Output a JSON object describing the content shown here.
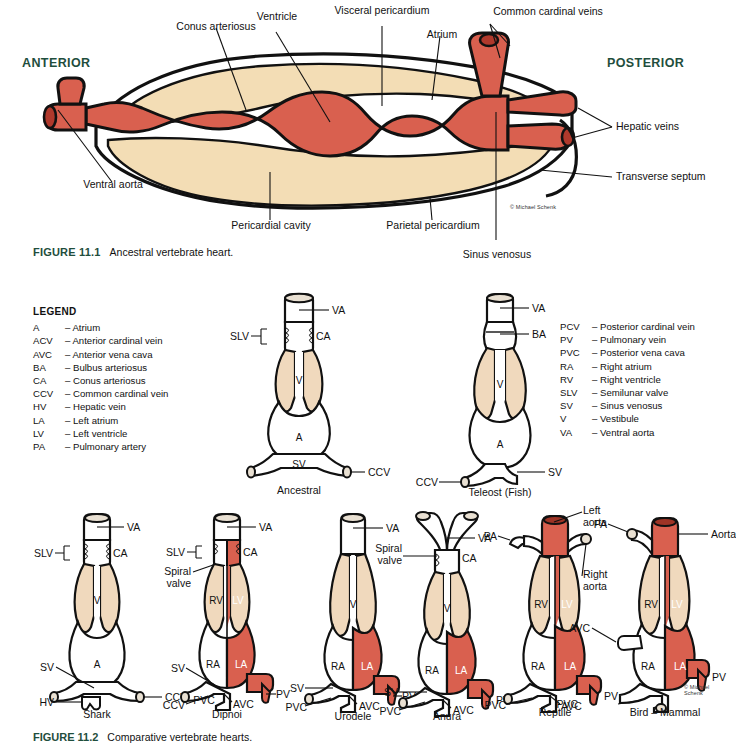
{
  "figure1": {
    "caption_prefix": "FIGURE 11.1",
    "caption_text": "Ancestral vertebrate heart.",
    "anterior": "ANTERIOR",
    "posterior": "POSTERIOR",
    "credit": "© Michael Schenk",
    "labels": {
      "conus_arteriosus": "Conus arteriosus",
      "ventricle": "Ventricle",
      "visceral_pericardium": "Visceral pericardium",
      "atrium": "Atrium",
      "common_cardinal_veins": "Common cardinal veins",
      "hepatic_veins": "Hepatic veins",
      "transverse_septum": "Transverse septum",
      "ventral_aorta": "Ventral aorta",
      "pericardial_cavity": "Pericardial cavity",
      "parietal_pericardium": "Parietal pericardium",
      "sinus_venosus": "Sinus venosus"
    }
  },
  "legend": {
    "title": "LEGEND",
    "left": [
      {
        "abbr": "A",
        "term": "Atrium"
      },
      {
        "abbr": "ACV",
        "term": "Anterior cardinal vein"
      },
      {
        "abbr": "AVC",
        "term": "Anterior vena cava"
      },
      {
        "abbr": "BA",
        "term": "Bulbus arteriosus"
      },
      {
        "abbr": "CA",
        "term": "Conus arteriosus"
      },
      {
        "abbr": "CCV",
        "term": "Common cardinal vein"
      },
      {
        "abbr": "HV",
        "term": "Hepatic vein"
      },
      {
        "abbr": "LA",
        "term": "Left atrium"
      },
      {
        "abbr": "LV",
        "term": "Left ventricle"
      },
      {
        "abbr": "PA",
        "term": "Pulmonary artery"
      }
    ],
    "right": [
      {
        "abbr": "PCV",
        "term": "Posterior cardinal vein"
      },
      {
        "abbr": "PV",
        "term": "Pulmonary vein"
      },
      {
        "abbr": "PVC",
        "term": "Posterior vena cava"
      },
      {
        "abbr": "RA",
        "term": "Right atrium"
      },
      {
        "abbr": "RV",
        "term": "Right ventricle"
      },
      {
        "abbr": "SLV",
        "term": "Semilunar valve"
      },
      {
        "abbr": "SV",
        "term": "Sinus venosus"
      },
      {
        "abbr": "V",
        "term": "Vestibule"
      },
      {
        "abbr": "VA",
        "term": "Ventral aorta"
      }
    ],
    "dash": "–"
  },
  "figure2": {
    "caption_prefix": "FIGURE 11.2",
    "caption_text": "Comparative vertebrate hearts.",
    "credit": "© Michael Schenk",
    "hearts": [
      {
        "id": "ancestral",
        "name": "Ancestral",
        "inner": [
          {
            "text": "V",
            "color": "dark"
          },
          {
            "text": "A",
            "color": "dark"
          },
          {
            "text": "SV",
            "color": "dark"
          }
        ],
        "callouts": [
          "VA",
          "SLV",
          "CA",
          "CCV"
        ]
      },
      {
        "id": "teleost",
        "name": "Teleost (Fish)",
        "inner": [
          {
            "text": "V",
            "color": "dark"
          },
          {
            "text": "A",
            "color": "dark"
          }
        ],
        "callouts": [
          "VA",
          "BA",
          "CCV",
          "SV"
        ]
      },
      {
        "id": "shark",
        "name": "Shark",
        "inner": [
          {
            "text": "V",
            "color": "dark"
          },
          {
            "text": "A",
            "color": "dark"
          }
        ],
        "callouts": [
          "VA",
          "SLV",
          "CA",
          "SV",
          "HV",
          "CCV"
        ]
      },
      {
        "id": "dipnoi",
        "name": "Dipnoi",
        "inner": [
          {
            "text": "RV",
            "color": "dark"
          },
          {
            "text": "LV",
            "color": "white"
          },
          {
            "text": "RA",
            "color": "dark"
          },
          {
            "text": "LA",
            "color": "white"
          }
        ],
        "callouts": [
          "VA",
          "SLV",
          "CA",
          "Spiral valve",
          "SV",
          "CCV",
          "PVC",
          "AVC",
          "PV"
        ]
      },
      {
        "id": "urodele",
        "name": "Urodele",
        "inner": [
          {
            "text": "V",
            "color": "dark"
          },
          {
            "text": "RA",
            "color": "dark"
          },
          {
            "text": "LA",
            "color": "white"
          }
        ],
        "callouts": [
          "VA",
          "SV",
          "PVC",
          "AVC",
          "PV"
        ]
      },
      {
        "id": "anura",
        "name": "Anura",
        "inner": [
          {
            "text": "V",
            "color": "dark"
          },
          {
            "text": "RA",
            "color": "dark"
          },
          {
            "text": "LA",
            "color": "white"
          }
        ],
        "callouts": [
          "Spiral valve",
          "VA",
          "CA",
          "SV",
          "PVC",
          "AVC",
          "PV"
        ]
      },
      {
        "id": "reptile",
        "name": "Reptile",
        "inner": [
          {
            "text": "RV",
            "color": "dark"
          },
          {
            "text": "LV",
            "color": "white"
          },
          {
            "text": "RA",
            "color": "dark"
          },
          {
            "text": "LA",
            "color": "white"
          }
        ],
        "callouts": [
          "PA",
          "Left aorta",
          "Right aorta",
          "PVC",
          "AVC",
          "PV"
        ]
      },
      {
        "id": "bird-mammal",
        "name": "Bird – Mammal",
        "inner": [
          {
            "text": "RV",
            "color": "dark"
          },
          {
            "text": "LV",
            "color": "white"
          },
          {
            "text": "RA",
            "color": "dark"
          },
          {
            "text": "LA",
            "color": "white"
          }
        ],
        "callouts": [
          "PA",
          "Aorta",
          "AVC",
          "PVC",
          "PV"
        ]
      }
    ]
  },
  "colors": {
    "oxygenated_red": "#d9604f",
    "deep_red": "#c8503f",
    "pericardium_tan": "#f3ddb5",
    "ventricle_tan": "#f0d9bd",
    "outline": "#111111",
    "heading_green": "#1f4e3d",
    "white": "#ffffff"
  }
}
